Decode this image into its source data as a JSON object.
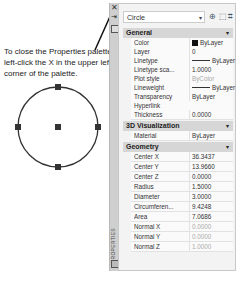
{
  "callout": {
    "text": "To close the Properties palette, left-click the X in the upper left corner of the palette."
  },
  "drawing": {
    "object": "circle",
    "grips": [
      "top",
      "left",
      "right",
      "bottom",
      "center"
    ]
  },
  "palette_strip": {
    "close_glyph": "✕",
    "pin_glyph": "⇥",
    "vertical_title": "PROPERTIES"
  },
  "panel": {
    "object_select": "Circle",
    "toolbar": [
      "toggle-pickadd-icon",
      "select-objects-icon",
      "quick-select-icon"
    ],
    "sections": [
      {
        "title": "General",
        "rows": [
          {
            "label": "Color",
            "value": "ByLayer",
            "kind": "swatch"
          },
          {
            "label": "Layer",
            "value": "0"
          },
          {
            "label": "Linetype",
            "value": "ByLayer",
            "kind": "line"
          },
          {
            "label": "Linetype sca...",
            "value": "1.0000"
          },
          {
            "label": "Plot style",
            "value": "ByColor",
            "gray": true
          },
          {
            "label": "Lineweight",
            "value": "ByLayer",
            "kind": "line"
          },
          {
            "label": "Transparency",
            "value": "ByLayer"
          },
          {
            "label": "Hyperlink",
            "value": ""
          },
          {
            "label": "Thickness",
            "value": "0.0000"
          }
        ]
      },
      {
        "title": "3D Visualization",
        "rows": [
          {
            "label": "Material",
            "value": "ByLayer"
          }
        ]
      },
      {
        "title": "Geometry",
        "rows": [
          {
            "label": "Center X",
            "value": "36.3437"
          },
          {
            "label": "Center Y",
            "value": "13.9660"
          },
          {
            "label": "Center Z",
            "value": "0.0000"
          },
          {
            "label": "Radius",
            "value": "1.5000"
          },
          {
            "label": "Diameter",
            "value": "3.0000"
          },
          {
            "label": "Circumferen...",
            "value": "9.4248"
          },
          {
            "label": "Area",
            "value": "7.0686"
          },
          {
            "label": "Normal X",
            "value": "0.0000",
            "gray": true
          },
          {
            "label": "Normal Y",
            "value": "0.0000",
            "gray": true
          },
          {
            "label": "Normal Z",
            "value": "1.0000",
            "gray": true
          }
        ]
      }
    ]
  }
}
